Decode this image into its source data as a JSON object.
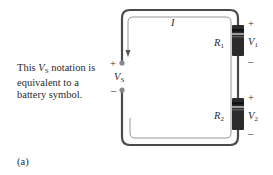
{
  "diagram": {
    "caption": "(a)",
    "note": {
      "prefix": "This ",
      "symbol": "V",
      "symbol_sub": "S",
      "suffix": " notation is equivalent to a battery symbol."
    },
    "current_label": "I",
    "source": {
      "label": "V",
      "sub": "S",
      "plus": "+",
      "minus": "–"
    },
    "resistors": [
      {
        "name": "R",
        "sub": "1",
        "voltage": "V",
        "vsub": "1",
        "plus": "+",
        "minus": "–"
      },
      {
        "name": "R",
        "sub": "2",
        "voltage": "V",
        "vsub": "2",
        "plus": "+",
        "minus": "–"
      }
    ],
    "colors": {
      "wire": "#4a4a4a",
      "resistor_body": "#2b2b2b",
      "band": "#9a9a9a",
      "loop": "#8a8a8a"
    }
  }
}
